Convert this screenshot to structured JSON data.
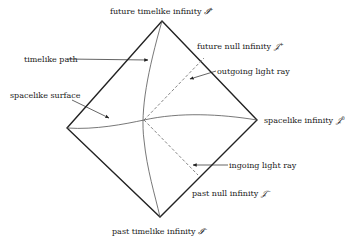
{
  "diagram": {
    "vertices": {
      "top": [
        162,
        21
      ],
      "right": [
        257,
        120
      ],
      "bottom": [
        160,
        217
      ],
      "left": [
        67,
        128
      ]
    },
    "labels": {
      "future_timelike_infinity": {
        "text": "future timelike infinity ",
        "symbol": "𝓘",
        "sup": "+"
      },
      "future_null_infinity": {
        "text": "future null infinity ",
        "symbol": "𝒥",
        "sup": "+"
      },
      "spacelike_infinity": {
        "text": "spacelike infinity ",
        "symbol": "𝒥",
        "sup": "0"
      },
      "past_null_infinity": {
        "text": "past null infinity ",
        "symbol": "𝒥",
        "sup": "−"
      },
      "past_timelike_infinity": {
        "text": "past timelike infinity ",
        "symbol": "𝓘",
        "sup": "−"
      },
      "timelike_path": {
        "text": "timelike path"
      },
      "spacelike_surface": {
        "text": "spacelike surface"
      },
      "outgoing_light_ray": {
        "text": "outgoing light ray"
      },
      "ingoing_light_ray": {
        "text": "ingoing light ray"
      }
    },
    "colors": {
      "boundary": "#222222",
      "curve": "#555555",
      "dashed": "#666666",
      "text": "#222222"
    }
  }
}
